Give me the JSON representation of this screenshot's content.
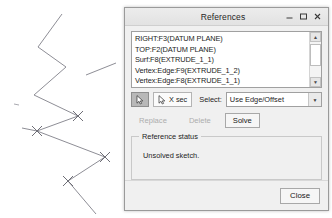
{
  "canvas": {
    "name": "sketch-canvas",
    "line_color": "#8e8e96",
    "vertex_marker": "x-cross",
    "polyline_points": "62,14 38,47 66,67 34,95 78,116 37,131 105,157 68,181 96,214",
    "extra_segment": "86,75 116,63",
    "vertices": [
      {
        "x": 78,
        "y": 116
      },
      {
        "x": 37,
        "y": 131
      },
      {
        "x": 105,
        "y": 157
      },
      {
        "x": 68,
        "y": 181
      }
    ]
  },
  "dialog": {
    "title": "References",
    "window_buttons": [
      {
        "name": "minimize",
        "glyph": "–"
      },
      {
        "name": "maximize",
        "glyph": "□"
      },
      {
        "name": "close",
        "glyph": "✕"
      }
    ],
    "references_list": {
      "name": "references-list",
      "items": [
        "RIGHT:F3(DATUM PLANE)",
        "TOP:F2(DATUM PLANE)",
        "Surf:F8(EXTRUDE_1_1)",
        "Vertex:Edge:F9(EXTRUDE_1_2)",
        "Vertex:Edge:F8(EXTRUDE_1_1)"
      ],
      "scroll_up_glyph": "▲",
      "scroll_down_glyph": "▼"
    },
    "toolbar": {
      "pick_button_label": "",
      "xsec_button_label": "X sec",
      "select_label": "Select:",
      "select_value": "Use Edge/Offset",
      "select_arrow_glyph": "▼"
    },
    "actions": {
      "replace_label": "Replace",
      "replace_enabled": false,
      "delete_label": "Delete",
      "delete_enabled": false,
      "solve_label": "Solve",
      "solve_enabled": true
    },
    "reference_status": {
      "group_title": "Reference status",
      "message": "Unsolved sketch."
    },
    "footer": {
      "close_label": "Close"
    }
  }
}
